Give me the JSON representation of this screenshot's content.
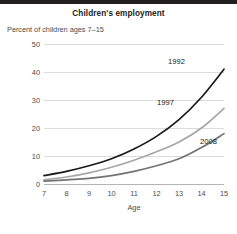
{
  "header": {
    "title": "Children's employment",
    "subtitle": "Percent of children ages 7–15"
  },
  "axes": {
    "x_label": "Age",
    "x_ticks": [
      "7",
      "8",
      "9",
      "10",
      "11",
      "12",
      "13",
      "14",
      "15"
    ],
    "y_ticks": [
      "0",
      "10",
      "20",
      "30",
      "40",
      "50"
    ]
  },
  "series_labels": {
    "s1992": "1992",
    "s1997": "1997",
    "s2008": "2008"
  },
  "colors": {
    "line_1992": "#1a1a1a",
    "line_1997": "#a6a6a6",
    "line_2008": "#737373",
    "grid": "#dcdcdc",
    "rule": "#231f20",
    "text": "#4d4d4d"
  },
  "chart_data": {
    "type": "line",
    "title": "Children's employment",
    "subtitle": "Percent of children ages 7–15",
    "xlabel": "Age",
    "ylabel": "Percent of children ages 7–15",
    "x": [
      7,
      8,
      9,
      10,
      11,
      12,
      13,
      14,
      15
    ],
    "xlim": [
      7,
      15
    ],
    "ylim": [
      0,
      50
    ],
    "yticks": [
      0,
      10,
      20,
      30,
      40,
      50
    ],
    "grid": true,
    "legend": "inline-labels",
    "series": [
      {
        "name": "1992",
        "color": "#1a1a1a",
        "values": [
          3.0,
          4.5,
          6.5,
          9.0,
          12.5,
          17.0,
          23.0,
          31.0,
          41.0
        ]
      },
      {
        "name": "1997",
        "color": "#a6a6a6",
        "values": [
          1.5,
          2.5,
          4.0,
          6.0,
          8.5,
          11.5,
          15.0,
          20.0,
          27.0
        ]
      },
      {
        "name": "2008",
        "color": "#737373",
        "values": [
          1.0,
          1.5,
          2.0,
          3.0,
          4.5,
          6.5,
          9.0,
          13.0,
          18.0
        ]
      }
    ]
  }
}
